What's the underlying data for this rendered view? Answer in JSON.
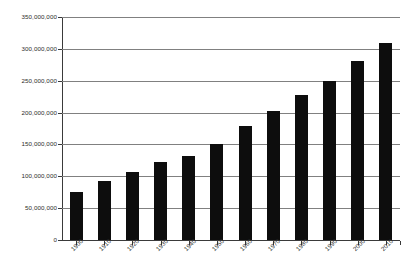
{
  "chart_data": {
    "type": "bar",
    "title": "",
    "subtitle": "",
    "xlabel": "",
    "ylabel": "",
    "categories": [
      "1900",
      "1910",
      "1920",
      "1930",
      "1940",
      "1950",
      "1960",
      "1970",
      "1980",
      "1990",
      "2000",
      "2010"
    ],
    "values": [
      76000000,
      92000000,
      106000000,
      123000000,
      132000000,
      151000000,
      179000000,
      203000000,
      227000000,
      249000000,
      281000000,
      309000000
    ],
    "series": [
      {
        "name": "Population",
        "values": [
          76000000,
          92000000,
          106000000,
          123000000,
          132000000,
          151000000,
          179000000,
          203000000,
          227000000,
          249000000,
          281000000,
          309000000
        ]
      }
    ],
    "ylim": [
      0,
      350000000
    ],
    "y_ticks": [
      0,
      50000000,
      100000000,
      150000000,
      200000000,
      250000000,
      300000000,
      350000000
    ],
    "y_tick_labels": [
      "0",
      "50,000,000",
      "100,000,000",
      "150,000,000",
      "200,000,000",
      "250,000,000",
      "300,000,000",
      "350,000,000"
    ],
    "grid": true,
    "grid_axis": "y",
    "legend": false,
    "legend_position": "none",
    "bar_color": "#0d0d0d",
    "grid_color": "#808080",
    "axis_color": "#3a3a3a",
    "background_color": "#ffffff",
    "annotations": []
  }
}
